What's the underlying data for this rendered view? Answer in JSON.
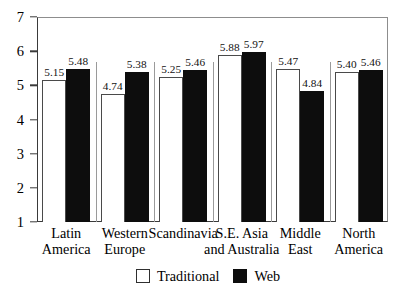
{
  "chart_data": {
    "type": "bar",
    "title": "",
    "subtitle": "",
    "xlabel": "",
    "ylabel": "",
    "ylim": [
      1,
      7
    ],
    "yticks": [
      1,
      2,
      3,
      4,
      5,
      6,
      7
    ],
    "ytick_labels": [
      "1",
      "2",
      "3",
      "4",
      "5",
      "6",
      "7"
    ],
    "grid": false,
    "legend_position": "bottom-center",
    "categories": [
      "Latin America",
      "Western Europe",
      "Scandinavia",
      "S.E. Asia and Australia",
      "Middle East",
      "North America"
    ],
    "category_lines": [
      [
        "Latin",
        "America"
      ],
      [
        "Western",
        "Europe"
      ],
      [
        "Scandinavia",
        ""
      ],
      [
        "S.E. Asia",
        "and Australia"
      ],
      [
        "Middle",
        "East"
      ],
      [
        "North",
        "America"
      ]
    ],
    "series": [
      {
        "name": "Traditional",
        "color": "#ffffff",
        "edge_color": "#4a4a4a",
        "values": [
          5.15,
          4.74,
          5.25,
          5.88,
          5.47,
          5.4
        ],
        "labels": [
          "5.15",
          "4.74",
          "5.25",
          "5.88",
          "5.47",
          "5.40"
        ]
      },
      {
        "name": "Web",
        "color": "#0d0d0d",
        "edge_color": "#0d0d0d",
        "values": [
          5.48,
          5.38,
          5.46,
          5.97,
          4.84,
          5.46
        ],
        "labels": [
          "5.48",
          "5.38",
          "5.46",
          "5.97",
          "4.84",
          "5.46"
        ]
      }
    ]
  },
  "legend": {
    "items": [
      {
        "label": "Traditional",
        "swatch": "white-square-swatch"
      },
      {
        "label": "Web",
        "swatch": "black-square-swatch"
      }
    ]
  }
}
